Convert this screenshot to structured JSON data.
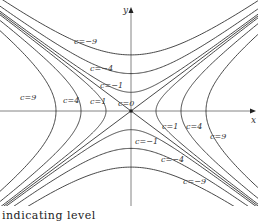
{
  "figure": {
    "axis_x_label": "x",
    "axis_y_label": "y",
    "caption": "indicating level"
  },
  "chart_data": {
    "type": "contour",
    "equation": "x^2 - y^2 = c",
    "levels": [
      9,
      4,
      1,
      0,
      -1,
      -4,
      -9
    ],
    "xlabel": "x",
    "ylabel": "y",
    "origin_px": [
      131,
      111
    ],
    "scale_px_per_unit": {
      "x": 25,
      "y": 18.7
    },
    "curves": [
      {
        "c": 9,
        "orientation": "horizontal-opening",
        "vertices": [
          [
            -3,
            0
          ],
          [
            3,
            0
          ]
        ]
      },
      {
        "c": 4,
        "orientation": "horizontal-opening",
        "vertices": [
          [
            -2,
            0
          ],
          [
            2,
            0
          ]
        ]
      },
      {
        "c": 1,
        "orientation": "horizontal-opening",
        "vertices": [
          [
            -1,
            0
          ],
          [
            1,
            0
          ]
        ]
      },
      {
        "c": 0,
        "orientation": "asymptotes",
        "lines": [
          "y = x",
          "y = -x"
        ]
      },
      {
        "c": -1,
        "orientation": "vertical-opening",
        "vertices": [
          [
            0,
            -1
          ],
          [
            0,
            1
          ]
        ]
      },
      {
        "c": -4,
        "orientation": "vertical-opening",
        "vertices": [
          [
            0,
            -2
          ],
          [
            0,
            2
          ]
        ]
      },
      {
        "c": -9,
        "orientation": "vertical-opening",
        "vertices": [
          [
            0,
            -3
          ],
          [
            0,
            3
          ]
        ]
      }
    ],
    "labels": [
      {
        "text": "c=9",
        "x": 20,
        "y": 100
      },
      {
        "text": "c=4",
        "x": 63,
        "y": 103
      },
      {
        "text": "c=1",
        "x": 90,
        "y": 104
      },
      {
        "text": "c=0",
        "x": 118,
        "y": 106
      },
      {
        "text": "c=−9",
        "x": 74,
        "y": 44
      },
      {
        "text": "c=−4",
        "x": 90,
        "y": 71
      },
      {
        "text": "c=−1",
        "x": 100,
        "y": 88
      },
      {
        "text": "c=1",
        "x": 162,
        "y": 129
      },
      {
        "text": "c=4",
        "x": 186,
        "y": 129
      },
      {
        "text": "c=9",
        "x": 210,
        "y": 139
      },
      {
        "text": "c=−1",
        "x": 135,
        "y": 144
      },
      {
        "text": "c=−4",
        "x": 161,
        "y": 162
      },
      {
        "text": "c=−9",
        "x": 183,
        "y": 184
      }
    ]
  }
}
